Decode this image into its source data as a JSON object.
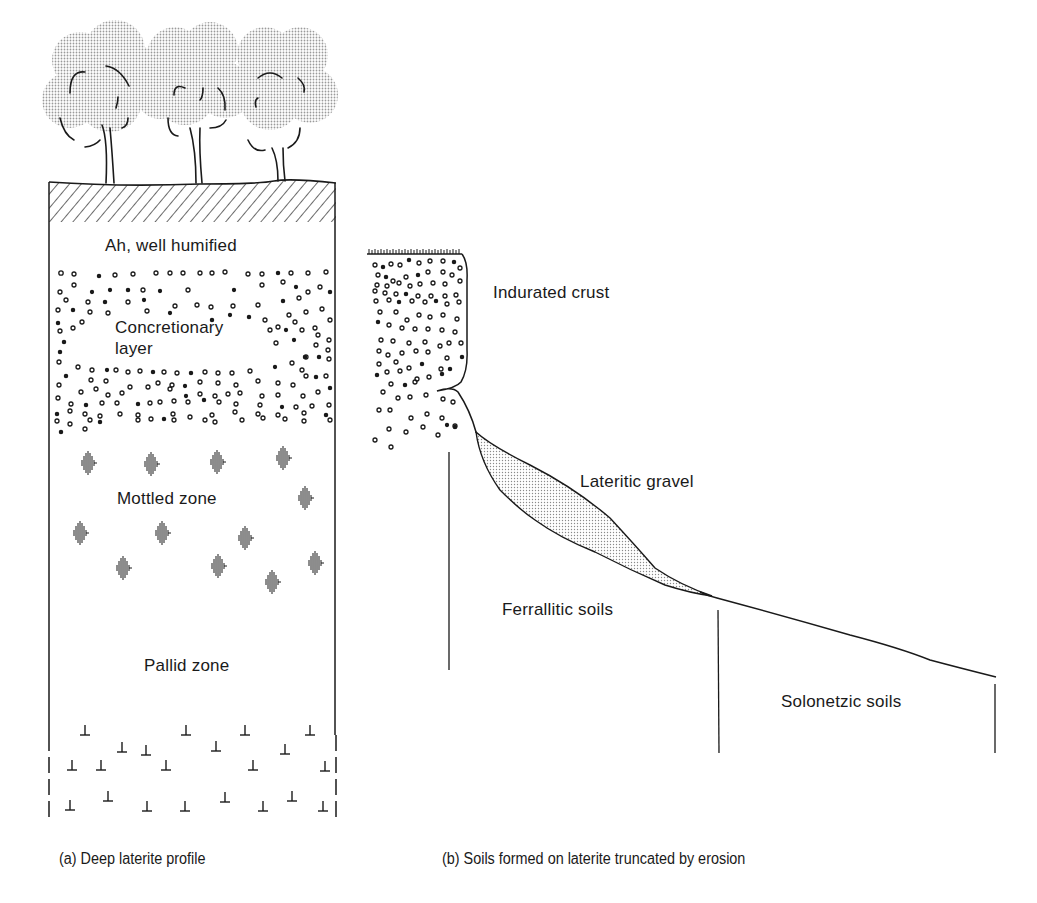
{
  "diagram": {
    "panel_a": {
      "caption": "(a) Deep laterite profile",
      "layers": [
        {
          "id": "ah",
          "label": "Ah, well humified",
          "pattern": "diagonal-hatch-top-band"
        },
        {
          "id": "concretionary",
          "label": "Concretionary layer",
          "label_lines": [
            "Concretionary",
            "layer"
          ],
          "pattern": "circles-dots"
        },
        {
          "id": "mottled",
          "label": "Mottled zone",
          "pattern": "vertical-line-mottles"
        },
        {
          "id": "pallid",
          "label": "Pallid zone",
          "pattern": "inverted-t-symbols"
        }
      ],
      "surface": "trees-on-hatched-surface"
    },
    "panel_b": {
      "caption": "(b) Soils formed on laterite truncated by erosion",
      "labels": {
        "crust": "Indurated crust",
        "gravel": "Lateritic gravel",
        "ferrallitic": "Ferrallitic soils",
        "solonetzic": "Solonetzic soils"
      }
    },
    "colors": {
      "ink": "#1a1a1a",
      "canopy_stipple": "#c8c8c8",
      "gravel_stipple": "#d6d6d6",
      "background": "#ffffff"
    }
  }
}
